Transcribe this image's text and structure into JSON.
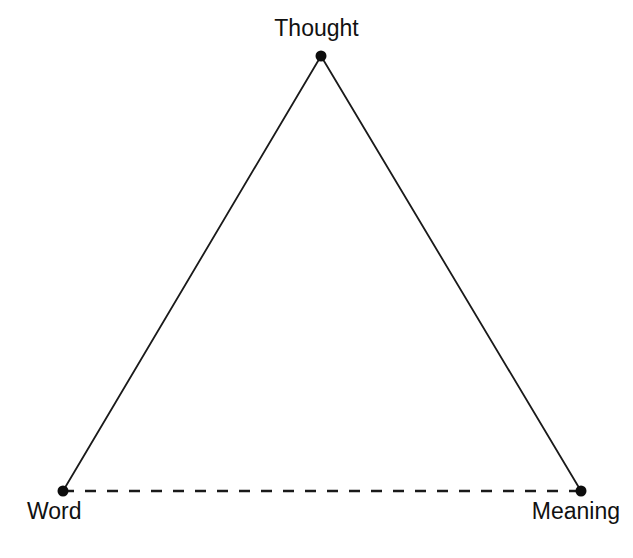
{
  "diagram": {
    "name": "semiotic-triangle",
    "background_color": "#ffffff",
    "stroke_color": "#1a1a1a",
    "labels": {
      "thought": "Thought",
      "word": "Word",
      "meaning": "Meaning"
    },
    "nodes": [
      {
        "id": "thought",
        "label": "Thought",
        "x": 321,
        "y": 56,
        "radius": 5.5
      },
      {
        "id": "word",
        "label": "Word",
        "x": 63,
        "y": 491,
        "radius": 5.5
      },
      {
        "id": "meaning",
        "label": "Meaning",
        "x": 581,
        "y": 491,
        "radius": 5.5
      }
    ],
    "edges": [
      {
        "id": "thought-word",
        "from": "thought",
        "to": "word",
        "style": "solid",
        "width": 1.8
      },
      {
        "id": "thought-meaning",
        "from": "thought",
        "to": "meaning",
        "style": "solid",
        "width": 1.8
      },
      {
        "id": "word-meaning",
        "from": "word",
        "to": "meaning",
        "style": "dashed",
        "width": 2.4,
        "dash_array": "11 11"
      }
    ]
  }
}
